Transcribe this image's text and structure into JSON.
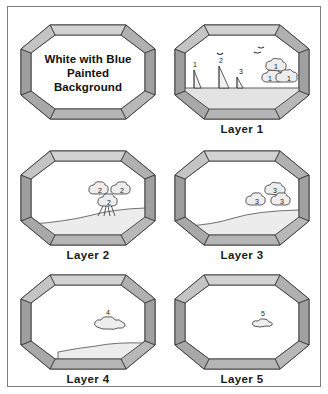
{
  "document": {
    "kind": "painting-layer-diagram",
    "border_color": "#7d7d7d",
    "page_background": "#ffffff"
  },
  "palette": {
    "frame_light": "#d9d9d9",
    "frame_mid": "#b3b3b3",
    "frame_dark": "#8c8c8c",
    "frame_outline": "#333333",
    "panel_interior": "#ffffff",
    "ground_fill": "#e6e6e6",
    "cloud_fill": "#ebebeb",
    "ink": "#1a1a1a"
  },
  "panels": [
    {
      "id": "title-panel",
      "label": "",
      "title_lines": [
        "White with Blue",
        "Painted",
        "Background"
      ],
      "scene": "empty"
    },
    {
      "id": "layer-1",
      "label": "Layer 1",
      "scene": "boats-birds-clouds-ground",
      "boats": [
        {
          "label": "1",
          "size": "medium"
        },
        {
          "label": "2",
          "size": "large"
        },
        {
          "label": "3",
          "size": "small"
        }
      ],
      "clouds": [
        {
          "label": "1"
        },
        {
          "label": "1"
        },
        {
          "label": "1"
        }
      ],
      "birds": 3,
      "has_ground": true
    },
    {
      "id": "layer-2",
      "label": "Layer 2",
      "scene": "cloud-cluster-with-stems-and-hill",
      "clouds": [
        {
          "label": "2"
        },
        {
          "label": "2"
        },
        {
          "label": "2"
        }
      ],
      "has_ground": true
    },
    {
      "id": "layer-3",
      "label": "Layer 3",
      "scene": "cloud-cluster-and-ground",
      "clouds": [
        {
          "label": "3"
        },
        {
          "label": "3"
        },
        {
          "label": "3"
        }
      ],
      "has_ground": true
    },
    {
      "id": "layer-4",
      "label": "Layer 4",
      "scene": "single-wide-cloud-and-ground",
      "clouds": [
        {
          "label": "4"
        }
      ],
      "has_ground": true
    },
    {
      "id": "layer-5",
      "label": "Layer 5",
      "scene": "single-small-cloud",
      "clouds": [
        {
          "label": "5"
        }
      ],
      "has_ground": false
    }
  ]
}
